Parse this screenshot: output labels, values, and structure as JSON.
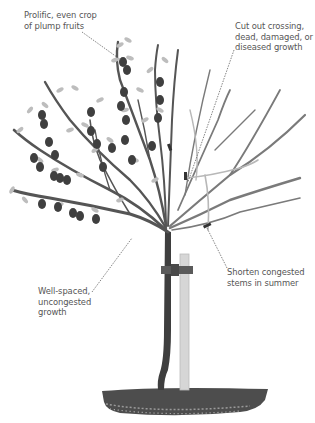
{
  "figure": {
    "colors": {
      "background": "#ffffff",
      "label_text": "#555555",
      "leader_line": "#666666",
      "branch_dark": "#4a4a4a",
      "branch_pruned": "#7a7a7a",
      "branch_removed": "#b5b5b5",
      "leaf": "#b9b9b9",
      "fruit": "#3f3f3f",
      "stake": "#d6d6d6",
      "tie": "#5a5a5a",
      "soil": "#4d4d4d"
    }
  },
  "annotations": [
    {
      "id": "fruits",
      "text": "Prolific, even crop\nof plump fruits"
    },
    {
      "id": "cut-out",
      "text": "Cut out crossing,\ndead, damaged, or\ndiseased growth"
    },
    {
      "id": "well-spaced",
      "text": "Well-spaced,\nuncongested\ngrowth"
    },
    {
      "id": "shorten",
      "text": "Shorten congested\nstems in summer"
    }
  ]
}
